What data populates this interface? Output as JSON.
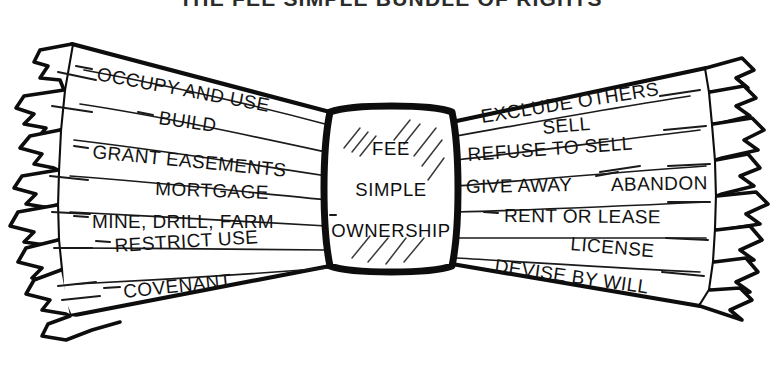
{
  "figure": {
    "title": "THE FEE SIMPLE BUNDLE OF RIGHTS",
    "style": "hand-drawn ink illustration of a frayed rope bundle tied in the middle",
    "ink_color": "#0d0d0d",
    "background_color": "#ffffff"
  },
  "center": {
    "name": "fee-simple-knot",
    "line1": "FEE",
    "line2": "SIMPLE",
    "line3": "OWNERSHIP"
  },
  "left_rights": [
    {
      "label": "OCCUPY AND USE"
    },
    {
      "label": "BUILD"
    },
    {
      "label": "GRANT EASEMENTS"
    },
    {
      "label": "MORTGAGE"
    },
    {
      "label": "MINE, DRILL, FARM"
    },
    {
      "label": "RESTRICT USE"
    },
    {
      "label": "COVENANT"
    }
  ],
  "right_rights": [
    {
      "label": "EXCLUDE OTHERS"
    },
    {
      "label": "SELL"
    },
    {
      "label": "REFUSE TO SELL"
    },
    {
      "label": "GIVE AWAY"
    },
    {
      "label": "ABANDON"
    },
    {
      "label": "RENT OR LEASE"
    },
    {
      "label": "LICENSE"
    },
    {
      "label": "DEVISE BY WILL"
    }
  ]
}
